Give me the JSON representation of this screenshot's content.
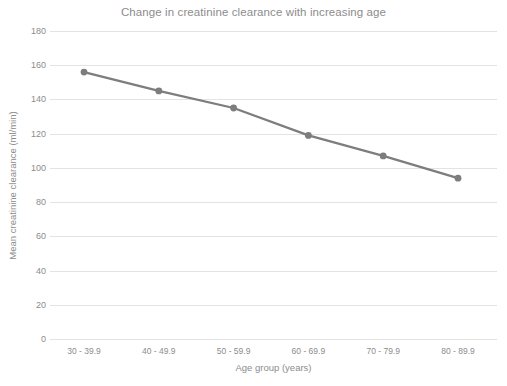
{
  "chart_data": {
    "type": "line",
    "title": "Change in creatinine clearance with increasing age",
    "xlabel": "Age group (years)",
    "ylabel": "Mean creatinine clearance (ml/min)",
    "categories": [
      "30 - 39.9",
      "40 - 49.9",
      "50 - 59.9",
      "60 - 69.9",
      "70 - 79.9",
      "80 - 89.9"
    ],
    "values": [
      156,
      145,
      135,
      119,
      107,
      94
    ],
    "ylim": [
      0,
      180
    ],
    "ytick_step": 20,
    "yticks": [
      0,
      20,
      40,
      60,
      80,
      100,
      120,
      140,
      160,
      180
    ],
    "ytick_labels": [
      "0",
      "20",
      "40",
      "60",
      "80",
      "100",
      "120",
      "140",
      "160",
      "180"
    ],
    "grid": "horizontal",
    "legend": "none",
    "series_color": "#7d7d7d",
    "marker": "circle",
    "gridline_color": "#e3e3e3",
    "text_color": "#8c8c8c",
    "background_color": "#ffffff"
  }
}
